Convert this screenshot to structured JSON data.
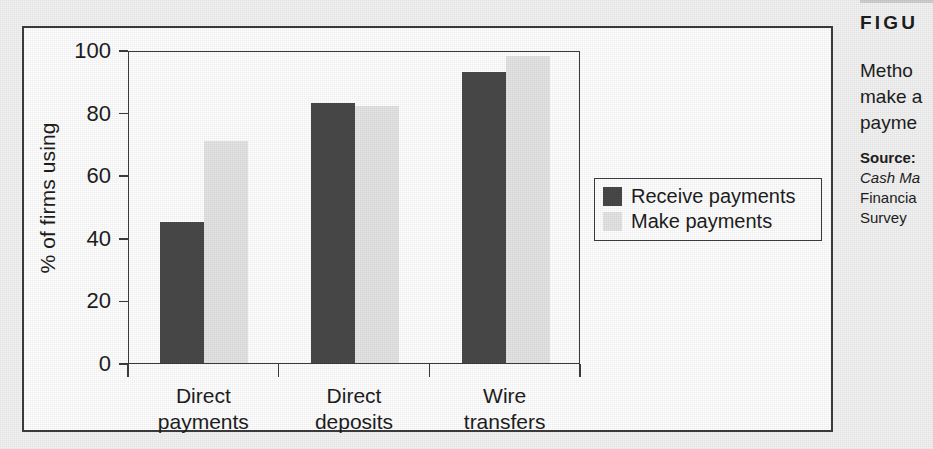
{
  "figure": {
    "kicker": "FIGU",
    "caption_lines": [
      "Metho",
      "make a",
      "payme"
    ],
    "source_label": "Source:",
    "source_lines": [
      "Cash Ma",
      "Financia",
      "Survey "
    ],
    "frame_color": "#3c3c3c",
    "background": "#ffffff"
  },
  "chart_data": {
    "type": "bar",
    "title": "",
    "xlabel": "",
    "ylabel": "% of firms using",
    "ylim": [
      0,
      100
    ],
    "yticks": [
      0,
      20,
      40,
      60,
      80,
      100
    ],
    "ytick_labels": [
      "0",
      "20",
      "40",
      "60",
      "80",
      "100"
    ],
    "categories": [
      "Direct payments",
      "Direct deposits",
      "Wire transfers"
    ],
    "category_lines": [
      [
        "Direct",
        "payments"
      ],
      [
        "Direct",
        "deposits"
      ],
      [
        "Wire",
        "transfers"
      ]
    ],
    "series": [
      {
        "name": "Receive payments",
        "color": "#484848",
        "values": [
          45,
          83,
          93
        ]
      },
      {
        "name": "Make payments",
        "color": "#e4e4e4",
        "values": [
          71,
          82,
          98
        ]
      }
    ],
    "legend_position": "right-outside",
    "grid": false
  }
}
